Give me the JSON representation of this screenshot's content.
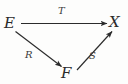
{
  "figure": {
    "kind": "commutative-diagram",
    "background_color": "#fdfdfc",
    "stroke_color": "#2b2b2b",
    "label_color": "#3a3a3a"
  },
  "objects": [
    {
      "id": "E",
      "label": "E",
      "position": "left"
    },
    {
      "id": "X",
      "label": "X",
      "position": "top-right"
    },
    {
      "id": "F",
      "label": "F",
      "position": "bottom-center"
    }
  ],
  "arrows": [
    {
      "id": "T",
      "label": "T",
      "from": "E",
      "to": "X",
      "label_position": "above-middle"
    },
    {
      "id": "R",
      "label": "R",
      "from": "E",
      "to": "F",
      "label_position": "left-of-arrow"
    },
    {
      "id": "S",
      "label": "S",
      "from": "F",
      "to": "X",
      "label_position": "right-of-arrow"
    }
  ]
}
